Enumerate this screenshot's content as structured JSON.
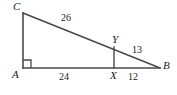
{
  "figure": {
    "type": "geometry-diagram",
    "background_color": "#ffffff",
    "stroke_color": "#4a4a4a",
    "label_color": "#1a1a1a"
  },
  "vertices": {
    "C": {
      "label": "C",
      "x": 23,
      "y": 13
    },
    "A": {
      "label": "A",
      "x": 23,
      "y": 68
    },
    "B": {
      "label": "B",
      "x": 160,
      "y": 68
    },
    "X": {
      "label": "X",
      "x": 114,
      "y": 68
    },
    "Y": {
      "label": "Y",
      "x": 114,
      "y": 47
    }
  },
  "segments": {
    "CA": {
      "name": "left-leg",
      "from": "C",
      "to": "A"
    },
    "AB": {
      "name": "base-leg",
      "from": "A",
      "to": "B"
    },
    "CB": {
      "name": "hypotenuse",
      "from": "C",
      "to": "B"
    },
    "XY": {
      "name": "perpendicular-segment",
      "from": "X",
      "to": "Y"
    }
  },
  "lengths": {
    "CY": "26",
    "AX": "24",
    "YB": "13",
    "XB": "12"
  },
  "markers": {
    "right_angle": {
      "at": "A",
      "size": 8
    }
  }
}
